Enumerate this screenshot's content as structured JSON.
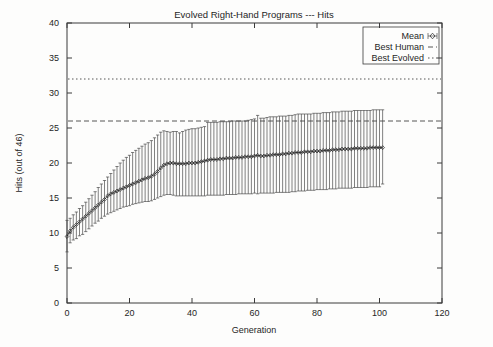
{
  "chart_data": {
    "type": "line",
    "title": "Evolved Right-Hand Programs --- Hits",
    "xlabel": "Generation",
    "ylabel": "Hits (out of 46)",
    "xlim": [
      0,
      120
    ],
    "ylim": [
      0,
      40
    ],
    "xticks": [
      0,
      20,
      40,
      60,
      80,
      100,
      120
    ],
    "yticks": [
      0,
      5,
      10,
      15,
      20,
      25,
      30,
      35,
      40
    ],
    "grid": false,
    "legend_position": "top-right",
    "legend": [
      {
        "label": "Mean",
        "style": "marker-errorbar"
      },
      {
        "label": "Best Human",
        "style": "dashed-line"
      },
      {
        "label": "Best Evolved",
        "style": "dotted-line"
      }
    ],
    "annotations": [
      {
        "name": "Best Human",
        "value": 26.0,
        "style": "dashed horizontal line"
      },
      {
        "name": "Best Evolved",
        "value": 32.0,
        "style": "dotted horizontal line"
      }
    ],
    "series": [
      {
        "name": "Mean",
        "x": [
          0,
          1,
          2,
          3,
          4,
          5,
          6,
          7,
          8,
          9,
          10,
          11,
          12,
          13,
          14,
          15,
          16,
          17,
          18,
          19,
          20,
          21,
          22,
          23,
          24,
          25,
          26,
          27,
          28,
          29,
          30,
          31,
          32,
          33,
          34,
          35,
          36,
          37,
          38,
          39,
          40,
          41,
          42,
          43,
          44,
          45,
          46,
          47,
          48,
          49,
          50,
          51,
          52,
          53,
          54,
          55,
          56,
          57,
          58,
          59,
          60,
          61,
          62,
          63,
          64,
          65,
          66,
          67,
          68,
          69,
          70,
          71,
          72,
          73,
          74,
          75,
          76,
          77,
          78,
          79,
          80,
          81,
          82,
          83,
          84,
          85,
          86,
          87,
          88,
          89,
          90,
          91,
          92,
          93,
          94,
          95,
          96,
          97,
          98,
          99,
          100,
          101
        ],
        "values": [
          9.5,
          10.3,
          10.8,
          11.2,
          11.6,
          12.0,
          12.4,
          12.8,
          13.2,
          13.6,
          14.0,
          14.4,
          14.8,
          15.3,
          15.6,
          15.8,
          16.0,
          16.2,
          16.4,
          16.6,
          16.8,
          17.0,
          17.2,
          17.4,
          17.6,
          17.8,
          17.9,
          18.1,
          18.4,
          18.8,
          19.3,
          19.7,
          19.9,
          20.0,
          20.0,
          19.9,
          19.9,
          19.9,
          19.9,
          20.0,
          20.0,
          20.0,
          20.1,
          20.2,
          20.3,
          20.4,
          20.5,
          20.5,
          20.5,
          20.6,
          20.6,
          20.7,
          20.7,
          20.7,
          20.8,
          20.8,
          20.8,
          20.9,
          20.9,
          20.9,
          21.0,
          21.1,
          21.0,
          21.0,
          21.1,
          21.1,
          21.2,
          21.2,
          21.2,
          21.3,
          21.3,
          21.4,
          21.4,
          21.5,
          21.5,
          21.5,
          21.6,
          21.6,
          21.6,
          21.7,
          21.7,
          21.7,
          21.8,
          21.8,
          21.8,
          21.9,
          21.9,
          21.9,
          22.0,
          22.0,
          22.0,
          22.0,
          22.1,
          22.1,
          22.1,
          22.1,
          22.1,
          22.2,
          22.2,
          22.2,
          22.2,
          22.2
        ],
        "err_low": [
          7.3,
          8.6,
          9.0,
          9.2,
          9.6,
          9.8,
          10.2,
          10.6,
          11.0,
          11.4,
          11.7,
          12.1,
          12.4,
          12.7,
          12.9,
          13.1,
          13.3,
          13.5,
          13.7,
          13.8,
          13.9,
          14.1,
          14.2,
          14.3,
          14.4,
          14.5,
          14.5,
          14.6,
          14.8,
          15.0,
          15.2,
          15.4,
          15.5,
          15.5,
          15.4,
          15.3,
          15.3,
          15.3,
          15.3,
          15.3,
          15.3,
          15.3,
          15.3,
          15.3,
          15.3,
          15.4,
          15.4,
          15.4,
          15.4,
          15.4,
          15.4,
          15.5,
          15.5,
          15.5,
          15.5,
          15.6,
          15.6,
          15.6,
          15.6,
          15.6,
          15.7,
          15.6,
          15.7,
          15.7,
          15.7,
          15.7,
          15.7,
          15.8,
          15.8,
          15.8,
          15.8,
          15.8,
          15.9,
          15.9,
          16.0,
          16.0,
          16.0,
          16.1,
          16.1,
          16.1,
          16.2,
          16.2,
          16.2,
          16.2,
          16.3,
          16.3,
          16.3,
          16.4,
          16.4,
          16.4,
          16.4,
          16.4,
          16.5,
          16.5,
          16.5,
          16.5,
          16.5,
          16.6,
          16.6,
          16.6,
          16.6,
          17.0
        ],
        "err_high": [
          11.8,
          12.1,
          12.6,
          13.0,
          13.5,
          13.9,
          14.4,
          14.9,
          15.4,
          15.9,
          16.5,
          17.0,
          17.5,
          18.0,
          18.5,
          19.0,
          19.5,
          20.0,
          20.4,
          20.8,
          21.1,
          21.5,
          21.8,
          22.1,
          22.4,
          22.7,
          22.9,
          23.2,
          23.6,
          24.0,
          24.4,
          24.6,
          24.5,
          24.4,
          24.5,
          24.5,
          24.3,
          24.5,
          24.7,
          24.8,
          24.9,
          24.9,
          25.0,
          25.1,
          25.2,
          25.8,
          25.8,
          25.8,
          25.8,
          25.9,
          25.9,
          25.9,
          25.9,
          26.0,
          26.0,
          26.0,
          26.0,
          26.0,
          26.1,
          26.2,
          26.3,
          26.8,
          26.4,
          26.4,
          26.5,
          26.6,
          26.6,
          26.6,
          26.7,
          26.7,
          26.7,
          26.8,
          26.8,
          26.9,
          27.0,
          27.0,
          27.0,
          27.0,
          27.0,
          27.1,
          27.1,
          27.1,
          27.2,
          27.2,
          27.2,
          27.3,
          27.3,
          27.3,
          27.4,
          27.4,
          27.4,
          27.4,
          27.5,
          27.5,
          27.5,
          27.5,
          27.5,
          27.5,
          27.6,
          27.6,
          27.6,
          27.6
        ]
      }
    ]
  },
  "colors": {
    "axis": "#3a3a3a",
    "data": "#1e1e1e",
    "background": "#fdfdfc"
  }
}
